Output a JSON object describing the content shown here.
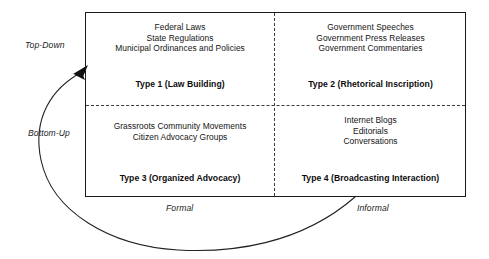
{
  "diagram": {
    "colors": {
      "box_border": "#1a1a1a",
      "divider": "#3b3b3b",
      "text": "#141414",
      "arrow": "#222222",
      "background": "#ffffff"
    },
    "axes": {
      "vertical": {
        "top_label": "Top-Down",
        "bottom_label": "Bottom-Up"
      },
      "horizontal": {
        "left_label": "Formal",
        "right_label": "Informal"
      }
    },
    "feedback_arrow": {
      "name": "bottom-up-feedback-arrow",
      "description": "curved arrow from lower-right of matrix sweeping below and left, arrowhead pointing up-right into the top-left corner of the matrix"
    },
    "quadrants": [
      {
        "position": "top-left",
        "items": [
          "Federal Laws",
          "State Regulations",
          "Municipal Ordinances and Policies"
        ],
        "type_label": "Type 1 (Law Building)"
      },
      {
        "position": "top-right",
        "items": [
          "Government Speeches",
          "Government Press Releases",
          "Government Commentaries"
        ],
        "type_label": "Type 2 (Rhetorical Inscription)"
      },
      {
        "position": "bottom-left",
        "items": [
          "Grassroots Community Movements",
          "Citizen Advocacy Groups"
        ],
        "type_label": "Type 3 (Organized Advocacy)"
      },
      {
        "position": "bottom-right",
        "items": [
          "Internet Blogs",
          "Editorials",
          "Conversations"
        ],
        "type_label": "Type 4 (Broadcasting Interaction)"
      }
    ]
  }
}
